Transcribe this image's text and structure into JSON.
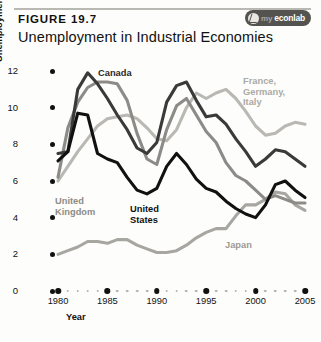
{
  "figure": {
    "number": "FIGURE 19.7",
    "title": "Unemployment in Industrial Economies",
    "logo": {
      "prefix": "my",
      "suffix": "econlab",
      "icon": "swirl-icon"
    }
  },
  "chart_data": {
    "type": "line",
    "title": "Unemployment in Industrial Economies",
    "xlabel": "Year",
    "ylabel": "Unemployment rate (percentage of labour force)",
    "xlim": [
      1980,
      2005
    ],
    "ylim": [
      0,
      12
    ],
    "grid": false,
    "legend_position": "inline-annotations",
    "x_ticks": [
      1980,
      1985,
      1990,
      1995,
      2000,
      2005
    ],
    "y_ticks": [
      0,
      2,
      4,
      6,
      8,
      10,
      12
    ],
    "x": [
      1980,
      1981,
      1982,
      1983,
      1984,
      1985,
      1986,
      1987,
      1988,
      1989,
      1990,
      1991,
      1992,
      1993,
      1994,
      1995,
      1996,
      1997,
      1998,
      1999,
      2000,
      2001,
      2002,
      2003,
      2004,
      2005
    ],
    "series": [
      {
        "name": "Canada",
        "color": "#3a3a3a",
        "values": [
          7.5,
          7.6,
          11.0,
          11.9,
          11.3,
          10.5,
          9.6,
          8.8,
          7.8,
          7.5,
          8.1,
          10.3,
          11.2,
          11.4,
          10.4,
          9.5,
          9.6,
          9.1,
          8.3,
          7.6,
          6.8,
          7.2,
          7.7,
          7.6,
          7.2,
          6.8
        ],
        "endpoint_value": 6.8,
        "peak_value": 11.9,
        "peak_year": 1983
      },
      {
        "name": "United States",
        "color": "#111111",
        "values": [
          7.1,
          7.6,
          9.7,
          9.6,
          7.5,
          7.2,
          7.0,
          6.2,
          5.5,
          5.3,
          5.6,
          6.8,
          7.5,
          6.9,
          6.1,
          5.6,
          5.4,
          4.9,
          4.5,
          4.2,
          4.0,
          4.7,
          5.8,
          6.0,
          5.5,
          5.1
        ],
        "endpoint_value": 5.1,
        "peak_value": 9.7,
        "peak_year": 1982
      },
      {
        "name": "United Kingdom",
        "color": "#8d8b87",
        "values": [
          6.2,
          8.9,
          10.3,
          11.1,
          11.4,
          11.4,
          11.3,
          10.4,
          8.6,
          7.2,
          6.9,
          8.8,
          10.1,
          10.5,
          9.6,
          8.7,
          8.1,
          7.0,
          6.3,
          6.0,
          5.5,
          5.0,
          5.2,
          5.0,
          4.8,
          4.8
        ],
        "endpoint_value": 4.8,
        "peak_value": 11.4,
        "peak_year": 1984
      },
      {
        "name": "France, Germany, Italy",
        "color": "#bab8b3",
        "values": [
          6.0,
          6.8,
          7.6,
          8.3,
          9.0,
          9.4,
          9.5,
          9.6,
          9.4,
          8.9,
          8.3,
          8.2,
          8.8,
          10.0,
          10.8,
          10.5,
          10.8,
          11.0,
          10.5,
          9.8,
          9.0,
          8.5,
          8.6,
          9.0,
          9.2,
          9.1
        ],
        "endpoint_value": 9.1,
        "peak_value": 11.0,
        "peak_year": 1997
      },
      {
        "name": "Japan",
        "color": "#a8a6a1",
        "values": [
          2.0,
          2.2,
          2.4,
          2.7,
          2.7,
          2.6,
          2.8,
          2.8,
          2.5,
          2.3,
          2.1,
          2.1,
          2.2,
          2.5,
          2.9,
          3.2,
          3.4,
          3.4,
          4.1,
          4.7,
          4.7,
          5.0,
          5.4,
          5.3,
          4.7,
          4.4
        ],
        "endpoint_value": 4.4,
        "peak_value": 5.4,
        "peak_year": 2002
      }
    ],
    "annotations": [
      {
        "name": "Canada",
        "label": "Canada"
      },
      {
        "name": "United Kingdom",
        "label": "United\nKingdom",
        "line1": "United",
        "line2": "Kingdom"
      },
      {
        "name": "United States",
        "label": "United\nStates",
        "line1": "United",
        "line2": "States"
      },
      {
        "name": "France, Germany, Italy",
        "line1": "France,",
        "line2": "Germany,",
        "line3": "Italy"
      },
      {
        "name": "Japan",
        "label": "Japan"
      }
    ]
  }
}
